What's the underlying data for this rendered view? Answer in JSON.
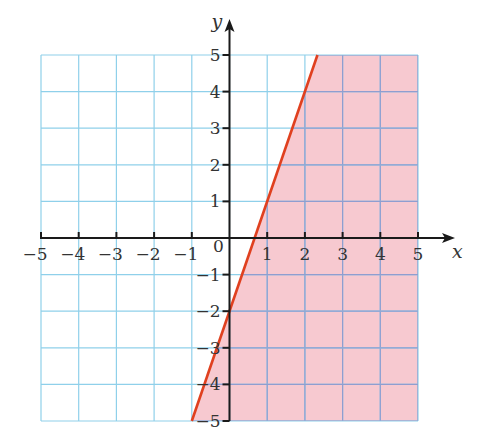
{
  "chart_data": {
    "type": "line",
    "title": "",
    "xlabel": "x",
    "ylabel": "y",
    "xlim": [
      -5,
      5
    ],
    "ylim": [
      -5,
      5
    ],
    "grid": true,
    "x_ticks": [
      "-5",
      "-4",
      "-3",
      "-2",
      "-1",
      "0",
      "1",
      "2",
      "3",
      "4",
      "5"
    ],
    "y_ticks": [
      "5",
      "4",
      "3",
      "2",
      "1",
      "-1",
      "-2",
      "-3",
      "-4",
      "-5"
    ],
    "origin_label": "0",
    "series": [
      {
        "name": "boundary line y = 3x - 2",
        "type": "line",
        "x": [
          -1,
          2.333
        ],
        "y": [
          -5,
          5
        ],
        "color": "#e0401f"
      }
    ],
    "shaded_region": {
      "description": "region to the right of / below the line y = 3x - 2",
      "inequality": "y < 3x - 2",
      "color": "#f7c9d0"
    },
    "colors": {
      "grid": "#8fd0ea",
      "grid_shaded": "#8f9ed0",
      "axis": "#1a1a1a",
      "line": "#e0401f",
      "shade": "#f7c9d0"
    }
  }
}
